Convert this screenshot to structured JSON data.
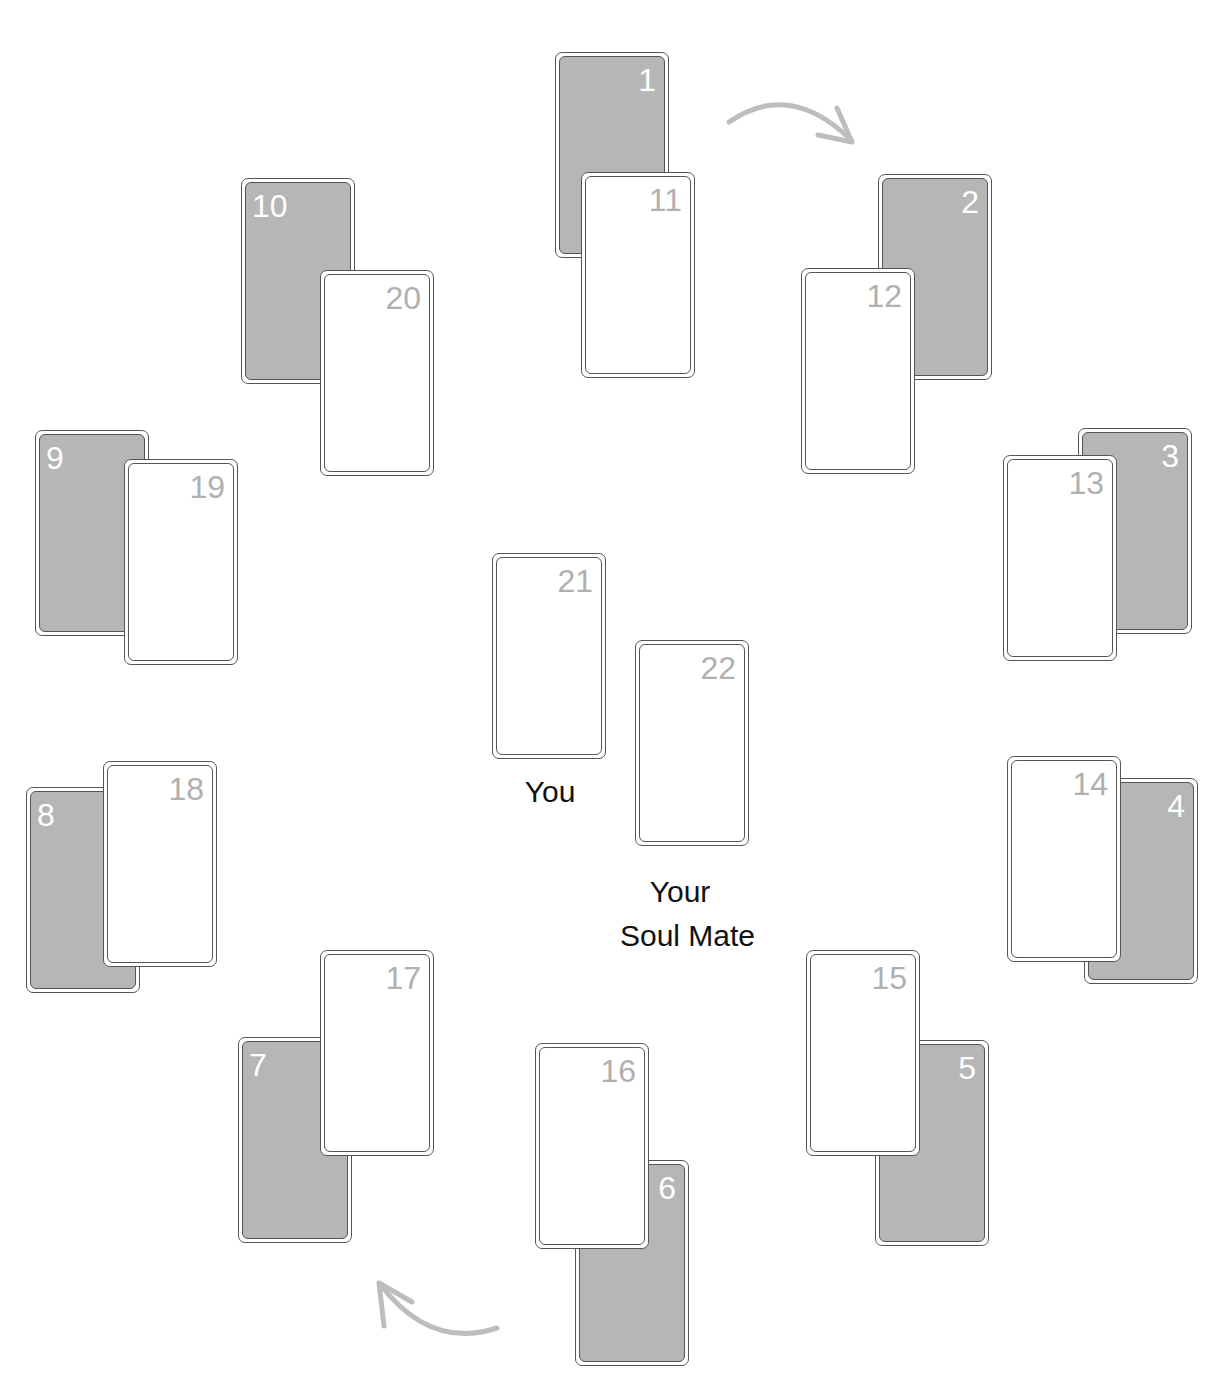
{
  "spread": {
    "cards": [
      {
        "id": "1",
        "number": "1",
        "face": "back",
        "x": 555,
        "y": 52,
        "num_pos": "right",
        "z": 1
      },
      {
        "id": "11",
        "number": "11",
        "face": "front",
        "x": 581,
        "y": 172,
        "num_pos": "right",
        "z": 2
      },
      {
        "id": "2",
        "number": "2",
        "face": "back",
        "x": 878,
        "y": 174,
        "num_pos": "right",
        "z": 1
      },
      {
        "id": "12",
        "number": "12",
        "face": "front",
        "x": 801,
        "y": 268,
        "num_pos": "right",
        "z": 2
      },
      {
        "id": "3",
        "number": "3",
        "face": "back",
        "x": 1078,
        "y": 428,
        "num_pos": "right",
        "z": 1
      },
      {
        "id": "13",
        "number": "13",
        "face": "front",
        "x": 1003,
        "y": 455,
        "num_pos": "right",
        "z": 2
      },
      {
        "id": "4",
        "number": "4",
        "face": "back",
        "x": 1084,
        "y": 778,
        "num_pos": "right",
        "z": 1
      },
      {
        "id": "14",
        "number": "14",
        "face": "front",
        "x": 1007,
        "y": 756,
        "num_pos": "right",
        "z": 2
      },
      {
        "id": "5",
        "number": "5",
        "face": "back",
        "x": 875,
        "y": 1040,
        "num_pos": "right",
        "z": 1
      },
      {
        "id": "15",
        "number": "15",
        "face": "front",
        "x": 806,
        "y": 950,
        "num_pos": "right",
        "z": 2
      },
      {
        "id": "6",
        "number": "6",
        "face": "back",
        "x": 575,
        "y": 1160,
        "num_pos": "right",
        "z": 1
      },
      {
        "id": "16",
        "number": "16",
        "face": "front",
        "x": 535,
        "y": 1043,
        "num_pos": "right",
        "z": 2
      },
      {
        "id": "7",
        "number": "7",
        "face": "back",
        "x": 238,
        "y": 1037,
        "num_pos": "left",
        "z": 1
      },
      {
        "id": "17",
        "number": "17",
        "face": "front",
        "x": 320,
        "y": 950,
        "num_pos": "right",
        "z": 2
      },
      {
        "id": "8",
        "number": "8",
        "face": "back",
        "x": 26,
        "y": 787,
        "num_pos": "left",
        "z": 1
      },
      {
        "id": "18",
        "number": "18",
        "face": "front",
        "x": 103,
        "y": 761,
        "num_pos": "right",
        "z": 2
      },
      {
        "id": "9",
        "number": "9",
        "face": "back",
        "x": 35,
        "y": 430,
        "num_pos": "left",
        "z": 1
      },
      {
        "id": "19",
        "number": "19",
        "face": "front",
        "x": 124,
        "y": 459,
        "num_pos": "right",
        "z": 2
      },
      {
        "id": "10",
        "number": "10",
        "face": "back",
        "x": 241,
        "y": 178,
        "num_pos": "left",
        "z": 1
      },
      {
        "id": "20",
        "number": "20",
        "face": "front",
        "x": 320,
        "y": 270,
        "num_pos": "right",
        "z": 2
      },
      {
        "id": "21",
        "number": "21",
        "face": "front",
        "x": 492,
        "y": 553,
        "num_pos": "right",
        "z": 2
      },
      {
        "id": "22",
        "number": "22",
        "face": "front",
        "x": 635,
        "y": 640,
        "num_pos": "right",
        "z": 2
      }
    ],
    "labels": {
      "you": "You",
      "soul_mate_line1": "Your",
      "soul_mate_line2": "Soul Mate"
    },
    "arrows": [
      {
        "name": "clockwise-arrow-top",
        "direction": "clockwise"
      },
      {
        "name": "clockwise-arrow-bottom",
        "direction": "clockwise"
      }
    ],
    "colors": {
      "card_back": "#b6b6b6",
      "card_border": "#555555",
      "back_number": "#ffffff",
      "front_number": "#b0b0b0",
      "arrow": "#bdbdbd",
      "label": "#111111"
    }
  }
}
